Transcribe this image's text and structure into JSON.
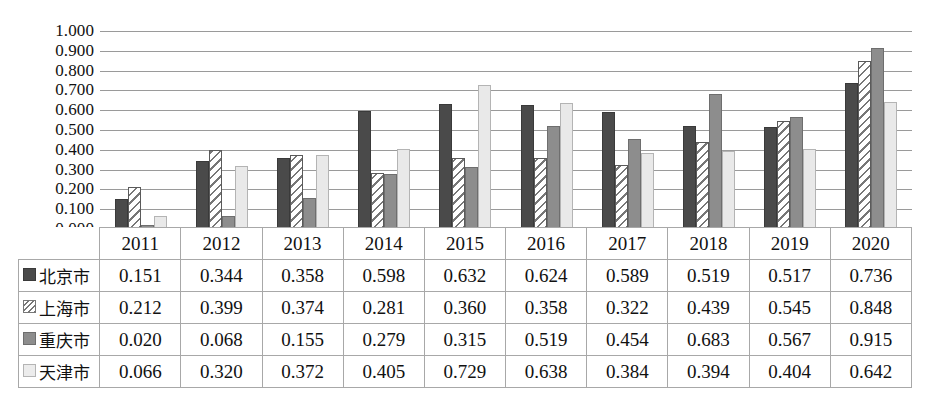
{
  "chart_data": {
    "type": "bar",
    "title": "",
    "subtitle": "",
    "xlabel": "",
    "ylabel": "",
    "grid": true,
    "legend_position": "table-row-headers",
    "ylim": [
      0.0,
      1.0
    ],
    "ytick_labels": [
      "1.000",
      "0.900",
      "0.800",
      "0.700",
      "0.600",
      "0.500",
      "0.400",
      "0.300",
      "0.200",
      "0.100",
      "0.000"
    ],
    "ytick_values": [
      1.0,
      0.9,
      0.8,
      0.7,
      0.6,
      0.5,
      0.4,
      0.3,
      0.2,
      0.1,
      0.0
    ],
    "categories": [
      "2011",
      "2012",
      "2013",
      "2014",
      "2015",
      "2016",
      "2017",
      "2018",
      "2019",
      "2020"
    ],
    "series": [
      {
        "name": "北京市",
        "pattern": "solid-dark",
        "color": "#4a4a4a",
        "values": [
          0.151,
          0.344,
          0.358,
          0.598,
          0.632,
          0.624,
          0.589,
          0.519,
          0.517,
          0.736
        ],
        "labels": [
          "0.151",
          "0.344",
          "0.358",
          "0.598",
          "0.632",
          "0.624",
          "0.589",
          "0.519",
          "0.517",
          "0.736"
        ]
      },
      {
        "name": "上海市",
        "pattern": "diagonal-hatch",
        "color": "#ffffff",
        "values": [
          0.212,
          0.399,
          0.374,
          0.281,
          0.36,
          0.358,
          0.322,
          0.439,
          0.545,
          0.848
        ],
        "labels": [
          "0.212",
          "0.399",
          "0.374",
          "0.281",
          "0.360",
          "0.358",
          "0.322",
          "0.439",
          "0.545",
          "0.848"
        ]
      },
      {
        "name": "重庆市",
        "pattern": "solid-midgray",
        "color": "#8d8d8d",
        "values": [
          0.02,
          0.068,
          0.155,
          0.279,
          0.315,
          0.519,
          0.454,
          0.683,
          0.567,
          0.915
        ],
        "labels": [
          "0.020",
          "0.068",
          "0.155",
          "0.279",
          "0.315",
          "0.519",
          "0.454",
          "0.683",
          "0.567",
          "0.915"
        ]
      },
      {
        "name": "天津市",
        "pattern": "solid-lightgray",
        "color": "#e9e9e9",
        "values": [
          0.066,
          0.32,
          0.372,
          0.405,
          0.729,
          0.638,
          0.384,
          0.394,
          0.404,
          0.642
        ],
        "labels": [
          "0.066",
          "0.320",
          "0.372",
          "0.405",
          "0.729",
          "0.638",
          "0.384",
          "0.394",
          "0.404",
          "0.642"
        ]
      }
    ]
  },
  "colors": {
    "series_1": "#4a4a4a",
    "series_2": "#ffffff",
    "series_3": "#8d8d8d",
    "series_4": "#e9e9e9",
    "gridline": "#9a9a9a",
    "table_border": "#a8a8a8",
    "text": "#111111",
    "background": "#ffffff"
  }
}
